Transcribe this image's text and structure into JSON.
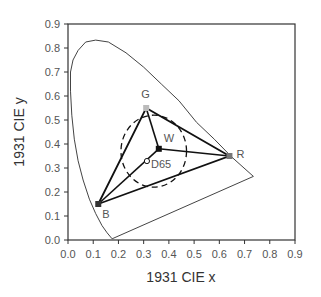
{
  "chart_data": {
    "type": "scatter",
    "title": "",
    "xlabel": "1931 CIE x",
    "ylabel": "1931 CIE y",
    "xlim": [
      0.0,
      0.9
    ],
    "ylim": [
      0.0,
      0.9
    ],
    "grid": false,
    "x_ticks": [
      "0.0",
      "0.1",
      "0.2",
      "0.3",
      "0.4",
      "0.5",
      "0.6",
      "0.7",
      "0.8",
      "0.9"
    ],
    "y_ticks": [
      "0.0",
      "0.1",
      "0.2",
      "0.3",
      "0.4",
      "0.5",
      "0.6",
      "0.7",
      "0.8",
      "0.9"
    ],
    "spectral_locus": [
      [
        0.175,
        0.005
      ],
      [
        0.155,
        0.03
      ],
      [
        0.135,
        0.06
      ],
      [
        0.11,
        0.11
      ],
      [
        0.085,
        0.17
      ],
      [
        0.06,
        0.25
      ],
      [
        0.04,
        0.33
      ],
      [
        0.025,
        0.42
      ],
      [
        0.015,
        0.52
      ],
      [
        0.01,
        0.62
      ],
      [
        0.01,
        0.7
      ],
      [
        0.02,
        0.75
      ],
      [
        0.04,
        0.79
      ],
      [
        0.07,
        0.825
      ],
      [
        0.11,
        0.833
      ],
      [
        0.16,
        0.825
      ],
      [
        0.23,
        0.78
      ],
      [
        0.3,
        0.72
      ],
      [
        0.37,
        0.65
      ],
      [
        0.44,
        0.58
      ],
      [
        0.51,
        0.49
      ],
      [
        0.58,
        0.42
      ],
      [
        0.65,
        0.345
      ],
      [
        0.735,
        0.265
      ],
      [
        0.175,
        0.005
      ]
    ],
    "primaries": {
      "R": {
        "x": 0.64,
        "y": 0.35,
        "label": "R"
      },
      "G": {
        "x": 0.31,
        "y": 0.55,
        "label": "G"
      },
      "B": {
        "x": 0.12,
        "y": 0.15,
        "label": "B"
      }
    },
    "white_points": [
      {
        "name": "W",
        "x": 0.36,
        "y": 0.38,
        "marker": "filled-square"
      },
      {
        "name": "D65",
        "x": 0.313,
        "y": 0.329,
        "marker": "open-circle"
      }
    ],
    "circle": {
      "cx": 0.34,
      "cy": 0.37,
      "rx": 0.13,
      "ry": 0.15,
      "style": "dashed"
    },
    "legend": null
  }
}
